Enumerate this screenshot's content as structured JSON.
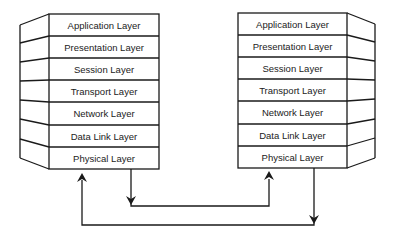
{
  "diagram": {
    "title": "",
    "stacks": [
      {
        "name": "left-host",
        "layers": [
          "Application Layer",
          "Presentation Layer",
          "Session Layer",
          "Transport Layer",
          "Network Layer",
          "Data Link Layer",
          "Physical Layer"
        ]
      },
      {
        "name": "right-host",
        "layers": [
          "Application Layer",
          "Presentation Layer",
          "Session Layer",
          "Transport Layer",
          "Network Layer",
          "Data Link Layer",
          "Physical Layer"
        ]
      }
    ],
    "connections": [
      {
        "from": "left-host Physical Layer",
        "to": "right-host Physical Layer",
        "direction": "left down, across, up into right"
      },
      {
        "from": "right-host Physical Layer",
        "to": "left-host Physical Layer",
        "direction": "right down, across bottom, up into left"
      }
    ],
    "colors": {
      "line": "#1a1a1a",
      "text": "#222222",
      "background": "#ffffff"
    }
  }
}
